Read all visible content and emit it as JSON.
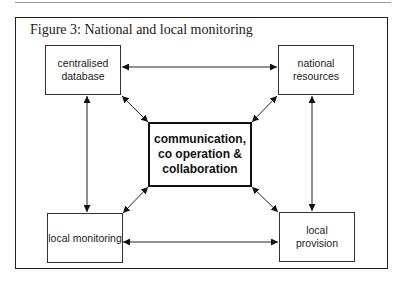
{
  "figure": {
    "title": "Figure 3: National and local monitoring",
    "nodes": {
      "centralised_database": "centralised database",
      "national_resources": "national resources",
      "center": "communication, co operation & collaboration",
      "local_monitoring": "local monitoring",
      "local_provision": "local provision"
    },
    "edges": [
      {
        "from": "centralised_database",
        "to": "national_resources",
        "type": "bidirectional"
      },
      {
        "from": "centralised_database",
        "to": "local_monitoring",
        "type": "bidirectional"
      },
      {
        "from": "national_resources",
        "to": "local_provision",
        "type": "bidirectional"
      },
      {
        "from": "local_monitoring",
        "to": "local_provision",
        "type": "bidirectional"
      },
      {
        "from": "center",
        "to": "centralised_database",
        "type": "bidirectional"
      },
      {
        "from": "center",
        "to": "national_resources",
        "type": "bidirectional"
      },
      {
        "from": "center",
        "to": "local_monitoring",
        "type": "bidirectional"
      },
      {
        "from": "center",
        "to": "local_provision",
        "type": "bidirectional"
      }
    ]
  }
}
